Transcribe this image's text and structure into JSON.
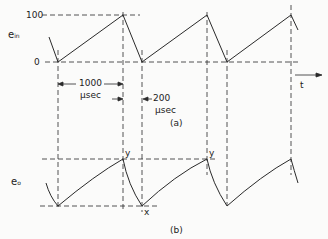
{
  "figure": {
    "panel_a": {
      "caption": "(a)",
      "signal_label": "e",
      "signal_subscript": "in",
      "y_ticks": [
        "100",
        "0"
      ],
      "interval_rise": {
        "value": "1000",
        "unit": "μsec"
      },
      "interval_fall": {
        "value": "200",
        "unit": "μsec"
      },
      "axis_label": "t"
    },
    "panel_b": {
      "caption": "(b)",
      "signal_label": "e",
      "signal_subscript": "o",
      "point_labels": {
        "peak_1": "y",
        "peak_2": "y",
        "trough": "x"
      }
    },
    "colors": {
      "ink": "#2a2a2a",
      "background": "#fbfbfa"
    }
  }
}
